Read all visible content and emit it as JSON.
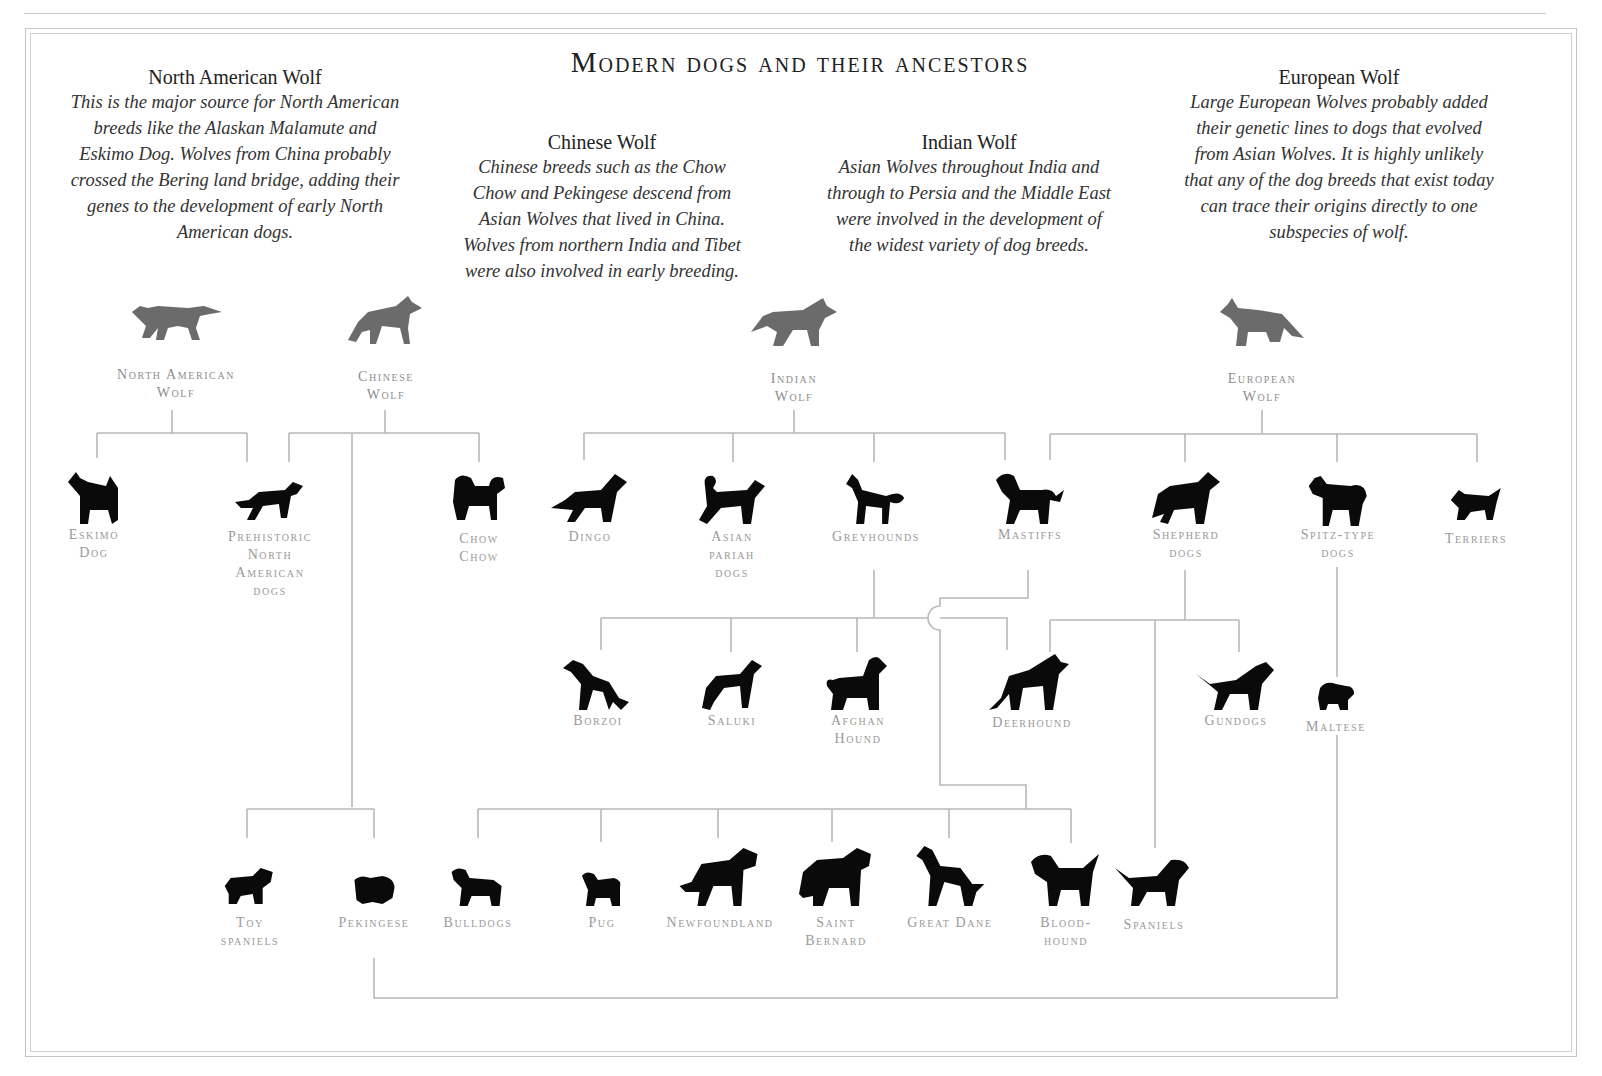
{
  "title": "Modern dogs and their ancestors",
  "descriptions": [
    {
      "heading": "North American Wolf",
      "text": "This is the major source for North American breeds like the Alaskan Malamute and Eskimo Dog. Wolves from China probably crossed the Bering land bridge, adding their genes to the development of early North American dogs."
    },
    {
      "heading": "Chinese Wolf",
      "text": "Chinese breeds such as the Chow Chow and Pekingese descend from Asian Wolves that lived in China. Wolves from northern India and Tibet were also involved in early breeding."
    },
    {
      "heading": "Indian Wolf",
      "text": "Asian Wolves throughout India and through to Persia and the Middle East were involved in the development of the widest variety of dog breeds."
    },
    {
      "heading": "European Wolf",
      "text": "Large European Wolves probably added their genetic lines to dogs that evolved from Asian Wolves. It is highly unlikely that any of the dog breeds that exist today can trace their origins directly to one subspecies of wolf."
    }
  ],
  "wolves": [
    {
      "label": "North American\nWolf",
      "icon": "wolf-silhouette"
    },
    {
      "label": "Chinese\nWolf",
      "icon": "wolf-silhouette"
    },
    {
      "label": "Indian\nWolf",
      "icon": "wolf-silhouette"
    },
    {
      "label": "European\nWolf",
      "icon": "wolf-silhouette"
    }
  ],
  "row1": [
    {
      "label": "Eskimo\nDog"
    },
    {
      "label": "Prehistoric\nNorth\nAmerican\ndogs"
    },
    {
      "label": "Chow\nChow"
    },
    {
      "label": "Dingo"
    },
    {
      "label": "Asian\npariah\ndogs"
    },
    {
      "label": "Greyhounds"
    },
    {
      "label": "Mastiffs"
    },
    {
      "label": "Shepherd\ndogs"
    },
    {
      "label": "Spitz-type\ndogs"
    },
    {
      "label": "Terriers"
    }
  ],
  "row2": [
    {
      "label": "Borzoi"
    },
    {
      "label": "Saluki"
    },
    {
      "label": "Afghan\nHound"
    },
    {
      "label": "Deerhound"
    },
    {
      "label": "Gundogs"
    },
    {
      "label": "Maltese"
    }
  ],
  "row3": [
    {
      "label": "Toy\nspaniels"
    },
    {
      "label": "Pekingese"
    },
    {
      "label": "Bulldogs"
    },
    {
      "label": "Pug"
    },
    {
      "label": "Newfoundland"
    },
    {
      "label": "Saint\nBernard"
    },
    {
      "label": "Great Dane"
    },
    {
      "label": "Blood-\nhound"
    },
    {
      "label": "Spaniels"
    }
  ],
  "colors": {
    "wolf": "#6b6b6b",
    "dog": "#0a0a0a",
    "line": "#b8b8b8",
    "label": "#9a9a9a"
  }
}
